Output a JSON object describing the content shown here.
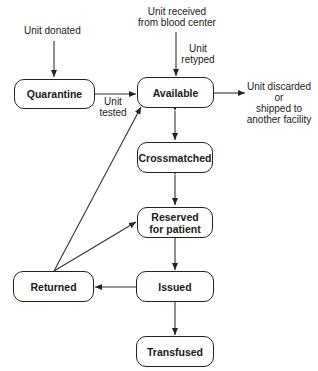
{
  "diagram": {
    "type": "state-transition",
    "nodes": [
      {
        "id": "quarantine",
        "label": "Quarantine"
      },
      {
        "id": "available",
        "label": "Available"
      },
      {
        "id": "crossmatched",
        "label": "Crossmatched"
      },
      {
        "id": "reserved",
        "label": "Reserved\nfor patient"
      },
      {
        "id": "returned",
        "label": "Returned"
      },
      {
        "id": "issued",
        "label": "Issued"
      },
      {
        "id": "transfused",
        "label": "Transfused"
      }
    ],
    "labels": {
      "unit_donated": "Unit donated",
      "unit_received_1": "Unit received",
      "unit_received_2": "from blood center",
      "unit_retyped_1": "Unit",
      "unit_retyped_2": "retyped",
      "unit_tested_1": "Unit",
      "unit_tested_2": "tested",
      "discarded_1": "Unit discarded",
      "discarded_2": "or",
      "discarded_3": "shipped to",
      "discarded_4": "another facility"
    },
    "edges": [
      {
        "from": "Unit donated",
        "to": "quarantine"
      },
      {
        "from": "quarantine",
        "to": "available",
        "label": "Unit tested"
      },
      {
        "from": "Unit received from blood center",
        "to": "available",
        "label": "Unit retyped"
      },
      {
        "from": "available",
        "to": "Unit discarded or shipped to another facility"
      },
      {
        "from": "available",
        "to": "crossmatched",
        "bidirectional": true
      },
      {
        "from": "crossmatched",
        "to": "reserved",
        "bidirectional": true
      },
      {
        "from": "reserved",
        "to": "issued"
      },
      {
        "from": "issued",
        "to": "returned"
      },
      {
        "from": "issued",
        "to": "transfused"
      },
      {
        "from": "returned",
        "to": "available"
      },
      {
        "from": "returned",
        "to": "reserved"
      }
    ],
    "colors": {
      "line": "#222222",
      "background": "#ffffff"
    }
  }
}
